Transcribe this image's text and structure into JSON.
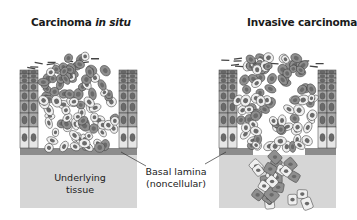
{
  "panels": [
    {
      "title_prefix": "Carcinoma ",
      "title_italic": "in situ",
      "description": "Tumor cells confined above basal lamina"
    },
    {
      "title": "Invasive carcinoma",
      "description": "Tumor cells breach basal lamina and invade underlying tissue"
    }
  ],
  "labels": {
    "tissue_line1": "Underlying",
    "tissue_line2": "tissue",
    "lamina_line1": "Basal lamina",
    "lamina_line2": "(noncellular)"
  },
  "colors": {
    "tissue": "#d6d6d6",
    "lamina": "#8c8c8c",
    "epithelium_light": "#e6e6e6",
    "epithelium_mid": "#a9a9a9",
    "epithelium_dark": "#8a8a8a",
    "tumor_dark": "#8f8f8f",
    "tumor_light": "#efefef",
    "nucleus": "#6a6a6a",
    "outline": "#3a3a3a"
  }
}
